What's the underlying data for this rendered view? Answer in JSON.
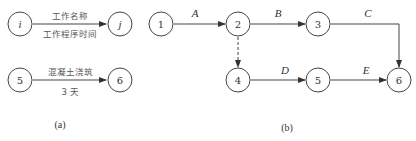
{
  "diagram_a": {
    "legend": {
      "start_node": "i",
      "end_node": "j",
      "label_top": "工作名称",
      "label_bottom": "工作程序时间"
    },
    "example": {
      "start_node": "5",
      "end_node": "6",
      "label_top": "混凝土浇筑",
      "label_bottom": "3 天"
    },
    "caption": "(a)"
  },
  "diagram_b": {
    "nodes": [
      {
        "id": "1",
        "x": 161,
        "y": 24
      },
      {
        "id": "2",
        "x": 238,
        "y": 24
      },
      {
        "id": "3",
        "x": 318,
        "y": 24
      },
      {
        "id": "4",
        "x": 238,
        "y": 80
      },
      {
        "id": "5",
        "x": 318,
        "y": 80
      },
      {
        "id": "6",
        "x": 399,
        "y": 80
      }
    ],
    "edges": [
      {
        "from": "1",
        "to": "2",
        "label": "A",
        "type": "solid"
      },
      {
        "from": "2",
        "to": "3",
        "label": "B",
        "type": "solid"
      },
      {
        "from": "3",
        "to": "6",
        "label": "C",
        "type": "solid"
      },
      {
        "from": "2",
        "to": "4",
        "label": "",
        "type": "dummy"
      },
      {
        "from": "4",
        "to": "5",
        "label": "D",
        "type": "solid"
      },
      {
        "from": "5",
        "to": "6",
        "label": "E",
        "type": "solid"
      }
    ],
    "caption": "(b)"
  }
}
